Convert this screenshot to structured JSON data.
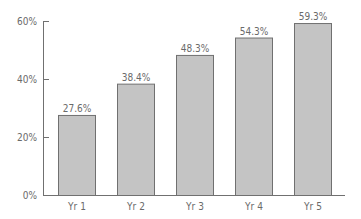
{
  "chart_data": {
    "type": "bar",
    "title": "",
    "xlabel": "",
    "ylabel": "",
    "categories": [
      "Yr 1",
      "Yr 2",
      "Yr 3",
      "Yr 4",
      "Yr 5"
    ],
    "values": [
      27.6,
      38.4,
      48.3,
      54.3,
      59.3
    ],
    "value_labels": [
      "27.6%",
      "38.4%",
      "48.3%",
      "54.3%",
      "59.3%"
    ],
    "ylim": [
      0,
      60
    ],
    "yticks": [
      0,
      20,
      40,
      60
    ],
    "ytick_labels": [
      "0%",
      "20%",
      "40%",
      "60%"
    ],
    "grid": false,
    "legend": null,
    "colors": {
      "bar_fill": "#c4c4c4",
      "bar_stroke": "#707070",
      "axis": "#707070",
      "text": "#6a6a6a"
    }
  }
}
